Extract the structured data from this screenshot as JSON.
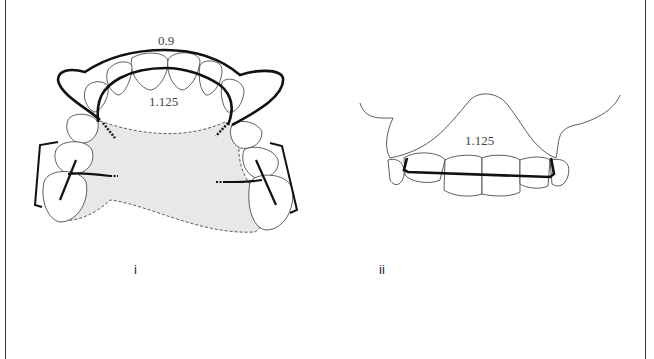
{
  "figure": {
    "panels": [
      {
        "id": "i",
        "label": "i",
        "view": "occlusal view of upper arch with appliance",
        "annotations": {
          "outer_wire": "0.9",
          "inner_wire": "1.125"
        }
      },
      {
        "id": "ii",
        "label": "ii",
        "view": "frontal view of upper incisors with labial bow",
        "annotations": {
          "bow": "1.125"
        }
      }
    ],
    "colors": {
      "line": "#111111",
      "thin_line": "#333333",
      "acrylic_fill": "#e6e6e6"
    }
  }
}
